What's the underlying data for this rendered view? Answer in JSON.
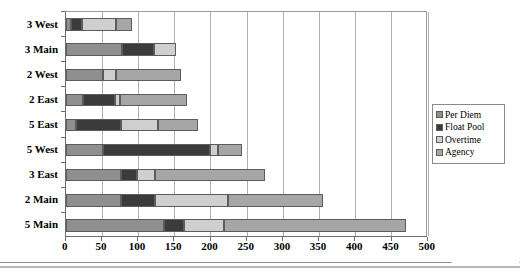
{
  "chart_data": {
    "type": "bar",
    "orientation": "horizontal",
    "stacked": true,
    "title": "",
    "xlabel": "",
    "ylabel": "",
    "xlim": [
      0,
      500
    ],
    "xticks": [
      0,
      50,
      100,
      150,
      200,
      250,
      300,
      350,
      400,
      450,
      500
    ],
    "grid": true,
    "legend_position": "right",
    "categories": [
      "3 West",
      "3 Main",
      "2 West",
      "2 East",
      "5 East",
      "5 West",
      "3 East",
      "2 Main",
      "5 Main"
    ],
    "series": [
      {
        "name": "Per Diem",
        "color": "#8f8f8f",
        "values": [
          7,
          78,
          51,
          24,
          14,
          51,
          76,
          76,
          136
        ]
      },
      {
        "name": "Float Pool",
        "color": "#3b3b3b",
        "values": [
          15,
          44,
          0,
          44,
          62,
          149,
          22,
          48,
          27
        ]
      },
      {
        "name": "Overtime",
        "color": "#cfcfcf",
        "values": [
          48,
          30,
          19,
          7,
          52,
          11,
          26,
          100,
          55
        ]
      },
      {
        "name": "Agency",
        "color": "#a6a6a6",
        "values": [
          21,
          0,
          89,
          93,
          55,
          33,
          151,
          131,
          252
        ]
      }
    ],
    "totals": [
      91,
      152,
      159,
      168,
      183,
      244,
      275,
      355,
      470
    ]
  },
  "legend": {
    "items": [
      {
        "label": "Per Diem"
      },
      {
        "label": "Float Pool"
      },
      {
        "label": "Overtime"
      },
      {
        "label": "Agency"
      }
    ]
  },
  "colors": {
    "per_diem": "#8f8f8f",
    "float_pool": "#3b3b3b",
    "overtime": "#cfcfcf",
    "agency": "#a6a6a6",
    "axis": "#6d6d6d",
    "grid": "#b0b0b0",
    "background": "#ffffff"
  }
}
